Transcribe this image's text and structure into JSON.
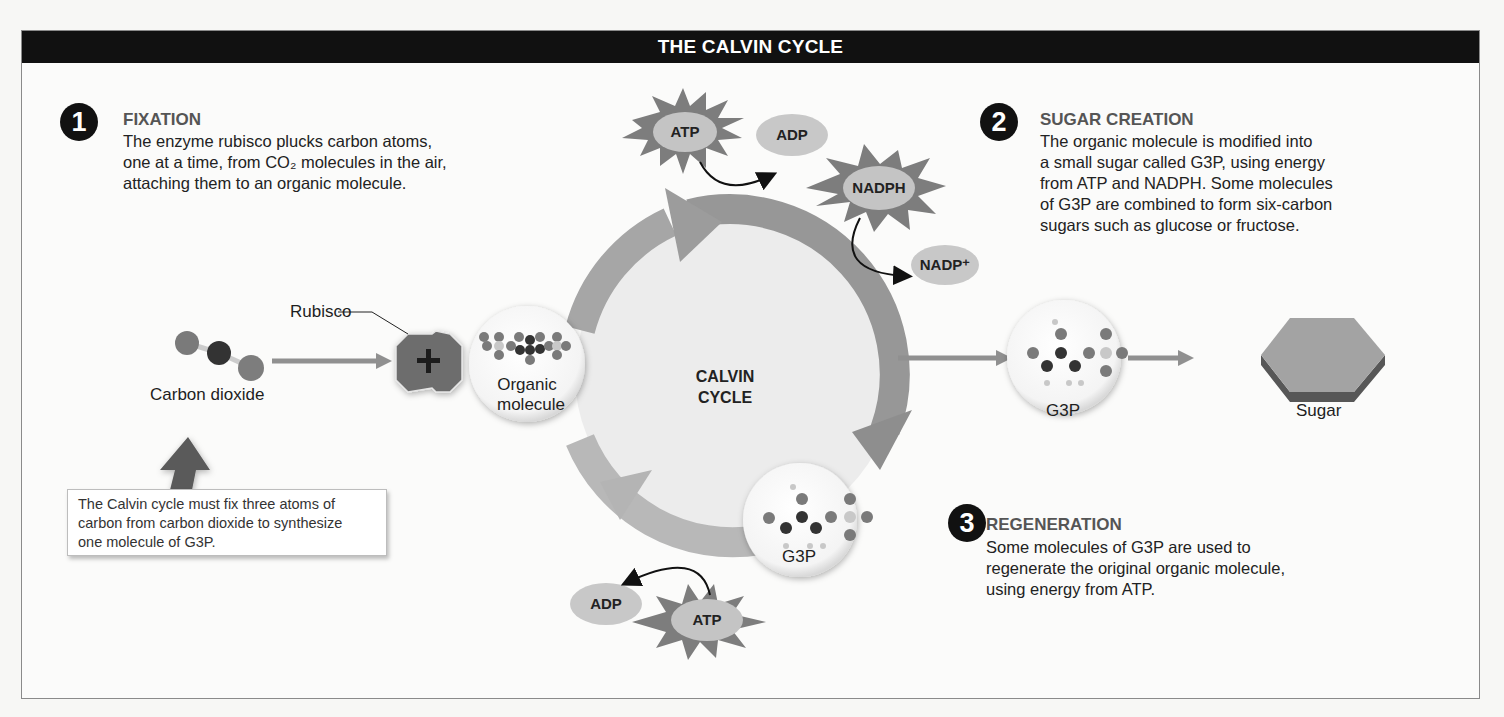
{
  "title": "THE CALVIN CYCLE",
  "steps": [
    {
      "number": "1",
      "title": "FIXATION",
      "body": [
        "The enzyme rubisco plucks carbon atoms,",
        "one at a time, from CO₂ molecules in the air,",
        "attaching them to an organic molecule."
      ]
    },
    {
      "number": "2",
      "title": "SUGAR CREATION",
      "body": [
        "The organic molecule is modified into",
        "a small sugar called G3P, using energy",
        "from ATP and NADPH.  Some molecules",
        "of G3P are combined to form six-carbon",
        "sugars such as glucose or fructose."
      ]
    },
    {
      "number": "3",
      "title": "REGENERATION",
      "body": [
        "Some molecules of G3P are used to",
        "regenerate the original organic molecule,",
        "using energy from ATP."
      ]
    }
  ],
  "labels": {
    "carbon_dioxide": "Carbon dioxide",
    "rubisco": "Rubisco",
    "organic_molecule_line1": "Organic",
    "organic_molecule_line2": "molecule",
    "cycle_line1": "CALVIN",
    "cycle_line2": "CYCLE",
    "g3p_cycle": "G3P",
    "g3p_output": "G3P",
    "sugar": "Sugar"
  },
  "molecules": {
    "atp_top": "ATP",
    "adp_top": "ADP",
    "nadph": "NADPH",
    "nadp": "NADP⁺",
    "atp_bottom": "ATP",
    "adp_bottom": "ADP"
  },
  "note": [
    "The Calvin cycle must fix three atoms of",
    "carbon from carbon dioxide to synthesize",
    "one molecule of G3P."
  ],
  "colors": {
    "title_bar": "#111111",
    "ring": "#9a9a9a",
    "ring_light": "#bdbdbd",
    "burst": "#7d7d7d",
    "oval": "#c4c4c4",
    "atom_dark": "#3a3a3a",
    "atom_mid": "#7a7a7a",
    "atom_light": "#c8c8c8"
  }
}
